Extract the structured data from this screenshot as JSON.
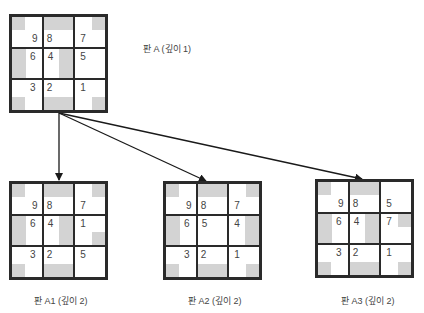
{
  "colors": {
    "border": "#2a2a2a",
    "shade": "#d3d3d3",
    "text": "#444444",
    "arrow": "#1a1a1a"
  },
  "boards": [
    {
      "id": "A",
      "label": "판 A (깊이 1)",
      "x": 9,
      "y": 14,
      "tiles": [
        9,
        8,
        7,
        6,
        4,
        5,
        3,
        2,
        1
      ]
    },
    {
      "id": "A1",
      "label": "판 A1 (깊이 2)",
      "x": 9,
      "y": 181,
      "tiles": [
        9,
        8,
        7,
        6,
        4,
        1,
        3,
        2,
        5
      ]
    },
    {
      "id": "A2",
      "label": "판 A2 (깊이 2)",
      "x": 163,
      "y": 181,
      "tiles": [
        9,
        8,
        7,
        6,
        5,
        4,
        3,
        2,
        1
      ]
    },
    {
      "id": "A3",
      "label": "판 A3 (깊이 2)",
      "x": 315,
      "y": 179,
      "tiles": [
        9,
        8,
        5,
        6,
        4,
        7,
        3,
        2,
        1
      ]
    }
  ],
  "labels": {
    "A": "판 A (깊이 1)",
    "A1": "판 A1 (깊이 2)",
    "A2": "판 A2 (깊이 2)",
    "A3": "판 A3 (깊이 2)"
  },
  "arrows": [
    {
      "from": "A",
      "to": "A1",
      "x1": 59,
      "y1": 113,
      "x2": 59,
      "y2": 181
    },
    {
      "from": "A",
      "to": "A2",
      "x1": 59,
      "y1": 113,
      "x2": 206,
      "y2": 181
    },
    {
      "from": "A",
      "to": "A3",
      "x1": 59,
      "y1": 113,
      "x2": 362,
      "y2": 179
    }
  ],
  "tile_shading": {
    "9": "top-left-square",
    "8": "top-band",
    "7": "top-right-square",
    "6": "left-band",
    "4": "right-band",
    "5": "none",
    "3": "bottom-left-square",
    "2": "bottom-band",
    "1": "bottom-right-square"
  }
}
